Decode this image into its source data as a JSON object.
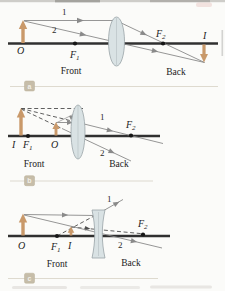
{
  "figure": {
    "panels": [
      {
        "tag": "a",
        "lens_type": "converging",
        "object_label": "O",
        "image_label": "I",
        "focal_letter": "F",
        "focal1_sub": "1",
        "focal2_sub": "2",
        "ray1_label": "1",
        "ray2_label": "2",
        "front_label": "Front",
        "back_label": "Back"
      },
      {
        "tag": "b",
        "lens_type": "converging",
        "object_label": "O",
        "image_label": "I",
        "focal_letter": "F",
        "focal1_sub": "1",
        "focal2_sub": "2",
        "ray1_label": "1",
        "ray2_label": "2",
        "front_label": "Front",
        "back_label": "Back"
      },
      {
        "tag": "c",
        "lens_type": "diverging",
        "object_label": "O",
        "image_label": "I",
        "focal_letter": "F",
        "focal1_sub": "1",
        "focal2_sub": "2",
        "ray1_label": "1",
        "ray2_label": "2",
        "front_label": "Front",
        "back_label": "Back"
      }
    ]
  },
  "colors": {
    "object_arrow": "#c9996a",
    "ray": "#8a8a8a",
    "dashed_construction": "#4d4d4d",
    "principal_axis": "#303030",
    "lens_fill": "#d9e2e4",
    "lens_stroke": "#99a3a7",
    "tag_box": "#c6bda9",
    "tag_line": "#dedacf",
    "label_text": "#1c1c1c"
  }
}
